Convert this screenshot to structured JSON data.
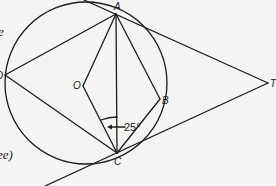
{
  "diagram": {
    "type": "circle-geometry",
    "points": {
      "A": "A",
      "B": "B",
      "C": "C",
      "D": "D",
      "O": "O",
      "T": "T"
    },
    "angle_label": "25°",
    "side_text_top": "e",
    "side_text_bottom": "ee)"
  }
}
